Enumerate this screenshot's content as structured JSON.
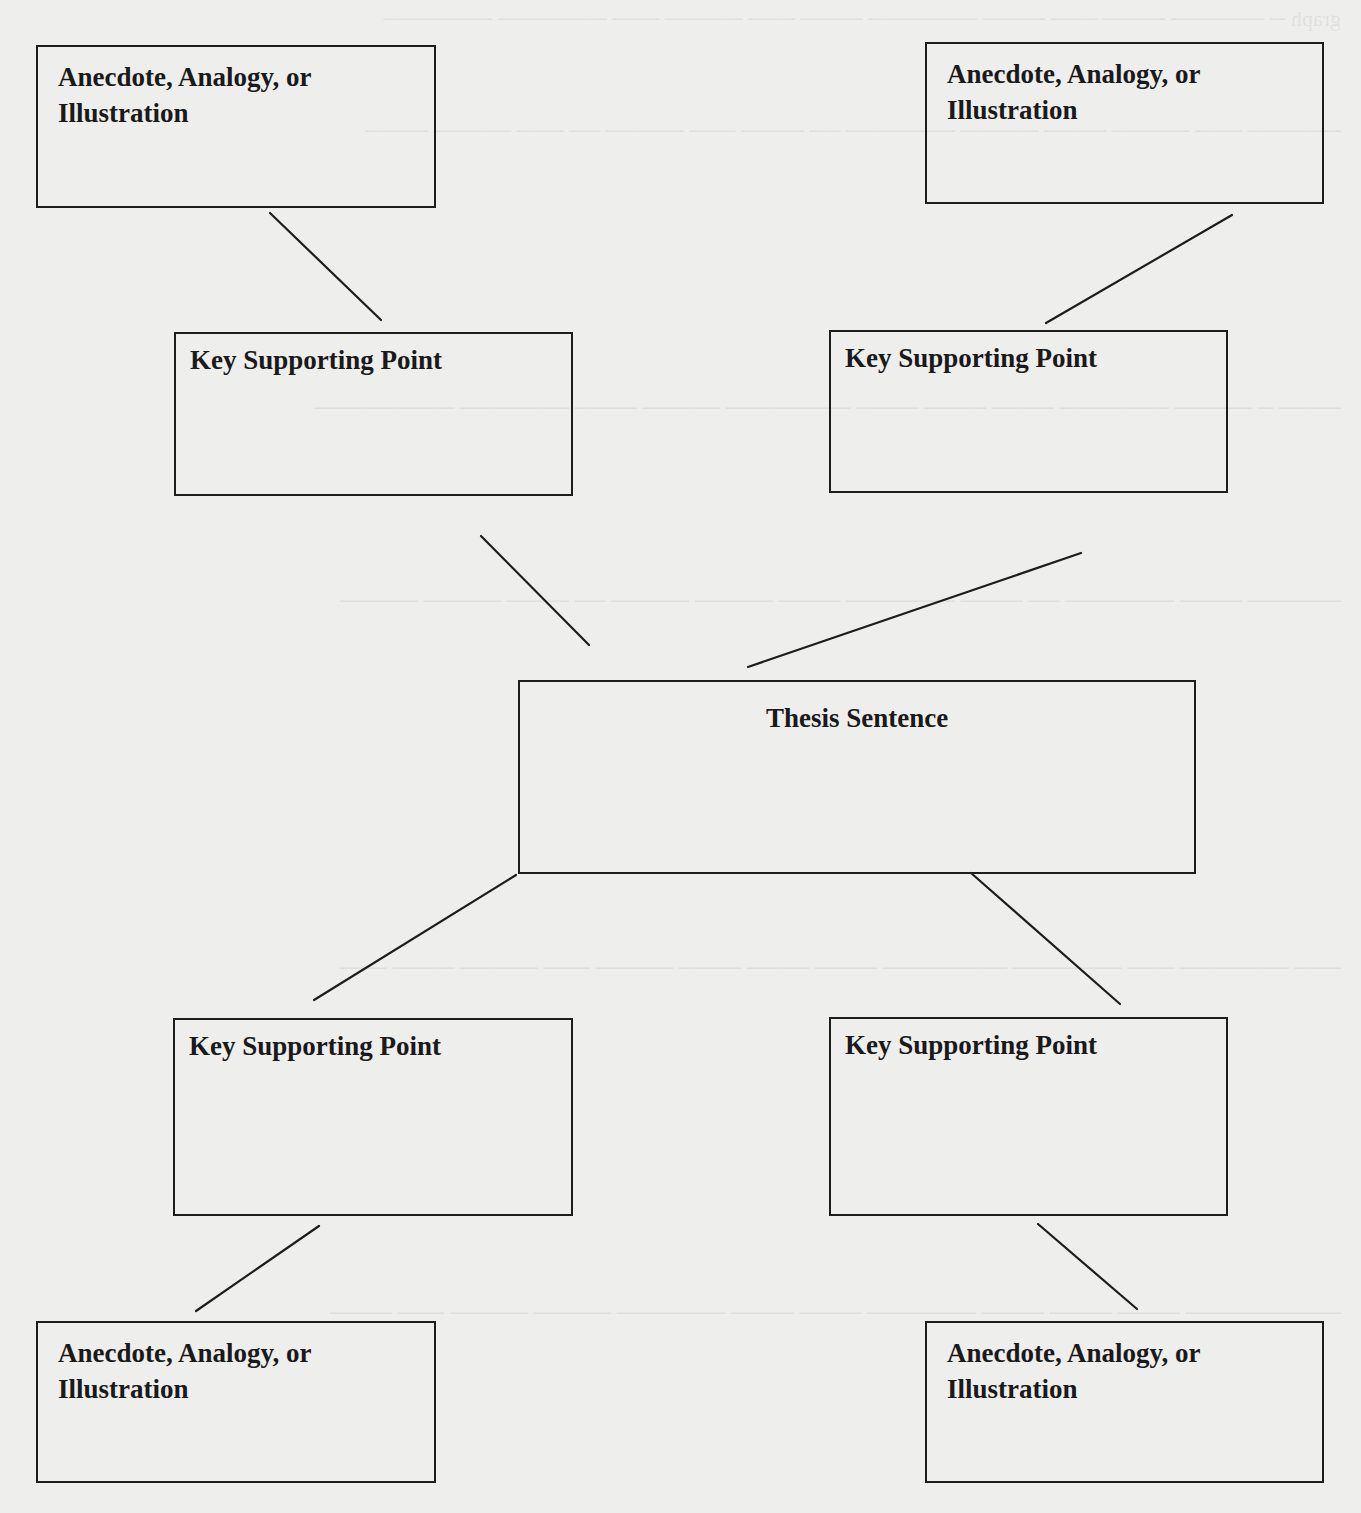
{
  "diagram": {
    "type": "thesis-support-map",
    "thesis": {
      "label": "Thesis Sentence"
    },
    "key_points": [
      {
        "id": "ksp-top-left",
        "label": "Key Supporting Point"
      },
      {
        "id": "ksp-top-right",
        "label": "Key Supporting Point"
      },
      {
        "id": "ksp-bottom-left",
        "label": "Key Supporting Point"
      },
      {
        "id": "ksp-bottom-right",
        "label": "Key Supporting Point"
      }
    ],
    "supports": [
      {
        "id": "anecdote-top-left",
        "label": "Anecdote, Analogy, or Illustration"
      },
      {
        "id": "anecdote-top-right",
        "label": "Anecdote, Analogy, or Illustration"
      },
      {
        "id": "anecdote-bottom-left",
        "label": "Anecdote, Analogy, or Illustration"
      },
      {
        "id": "anecdote-bottom-right",
        "label": "Anecdote, Analogy, or Illustration"
      }
    ],
    "connections": [
      {
        "from": "anecdote-top-left",
        "to": "ksp-top-left"
      },
      {
        "from": "anecdote-top-right",
        "to": "ksp-top-right"
      },
      {
        "from": "ksp-top-left",
        "to": "thesis"
      },
      {
        "from": "ksp-top-right",
        "to": "thesis"
      },
      {
        "from": "thesis",
        "to": "ksp-bottom-left"
      },
      {
        "from": "thesis",
        "to": "ksp-bottom-right"
      },
      {
        "from": "ksp-bottom-left",
        "to": "anecdote-bottom-left"
      },
      {
        "from": "ksp-bottom-right",
        "to": "anecdote-bottom-right"
      }
    ]
  },
  "colors": {
    "background": "#eeeeec",
    "stroke": "#1d1d1d",
    "text": "#1a1a1a"
  }
}
